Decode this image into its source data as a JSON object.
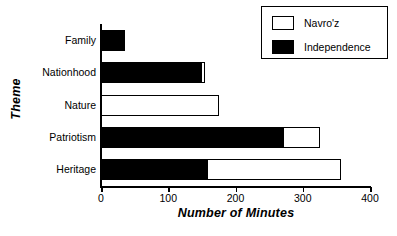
{
  "chart_data": {
    "type": "bar",
    "orientation": "horizontal",
    "stacked": true,
    "title": "",
    "xlabel": "Number of Minutes",
    "ylabel": "Theme",
    "categories": [
      "Family",
      "Nationhood",
      "Nature",
      "Patriotism",
      "Heritage"
    ],
    "series": [
      {
        "name": "Independence",
        "color": "#000000",
        "values": [
          35,
          148,
          0,
          270,
          158
        ]
      },
      {
        "name": "Navro'z",
        "color": "#ffffff",
        "values": [
          0,
          7,
          175,
          55,
          199
        ]
      }
    ],
    "totals": [
      35,
      155,
      175,
      325,
      357
    ],
    "xlim": [
      0,
      400
    ],
    "xticks": [
      0,
      100,
      200,
      300,
      400
    ],
    "xtick_labels": [
      "0",
      "100",
      "200",
      "300",
      "400"
    ],
    "grid": false,
    "legend_position": "top-right",
    "legend_entries": [
      {
        "label": "Navro'z",
        "swatch": "light"
      },
      {
        "label": "Independence",
        "swatch": "dark"
      }
    ]
  }
}
